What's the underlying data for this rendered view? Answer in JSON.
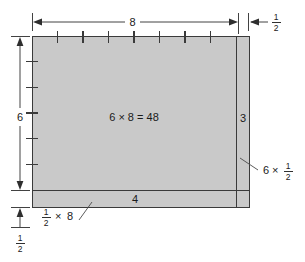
{
  "figure": {
    "colors": {
      "fill": "#c9c9c9",
      "stroke": "#3a3a3a",
      "text": "#1a1a1a",
      "background": "#ffffff"
    },
    "labels": {
      "top_dimension": "8",
      "left_dimension": "6",
      "center_product": "6 × 8 = 48",
      "right_strip_value": "4",
      "bottom_strip_value": "3",
      "right_strip_product_whole": "6",
      "right_strip_product_times": "×",
      "bottom_strip_product_times": "×",
      "bottom_strip_product_whole": "8"
    },
    "fractions": {
      "top_right_numerator": "1",
      "top_right_denominator": "2",
      "bottom_left_numerator": "1",
      "bottom_left_denominator": "2",
      "right_callout_numerator": "1",
      "right_callout_denominator": "2",
      "bottom_callout_numerator": "1",
      "bottom_callout_denominator": "2"
    },
    "ticks": {
      "top_count": 7,
      "left_count": 5
    },
    "regions": [
      {
        "name": "main-area",
        "label": "6 × 8 = 48"
      },
      {
        "name": "right-strip",
        "label": "3"
      },
      {
        "name": "bottom-strip",
        "label": "4"
      }
    ]
  }
}
